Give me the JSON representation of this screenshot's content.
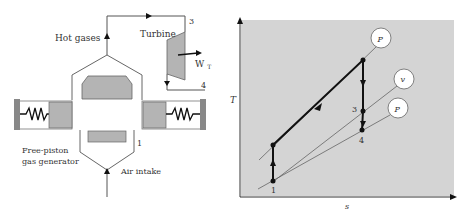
{
  "left_diagram": {
    "title": "Free-piston gas generator with turbine",
    "labels": {
      "hot_gases": "Hot gases",
      "turbine": "Turbine",
      "work_output": "W",
      "work_subscript": "T",
      "state_3": "3",
      "state_4": "4",
      "state_1": "1",
      "generator_line1": "Free-piston",
      "generator_line2": "gas generator",
      "air_intake": "Air intake"
    }
  },
  "right_diagram": {
    "axes": {
      "ylabel": "T",
      "xlabel": "s"
    },
    "points": {
      "p1": "1",
      "p3": "3",
      "p4": "4"
    },
    "isolines": {
      "upper_pressure": "P",
      "volume": "v",
      "lower_pressure": "P"
    }
  },
  "colors": {
    "component_fill": "#b4b4b4",
    "plot_background": "#d4d4d4",
    "line": "#444444",
    "heavy_line": "#111111"
  }
}
